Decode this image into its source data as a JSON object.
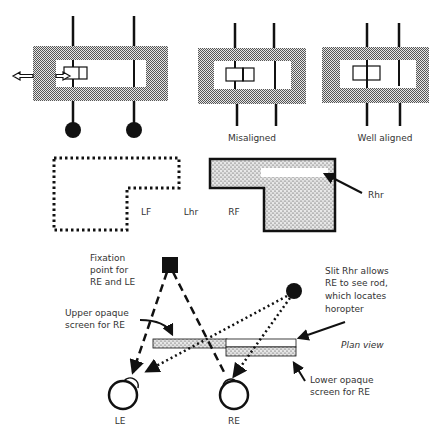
{
  "figure": {
    "colors": {
      "ink": "#111111",
      "text": "#333333",
      "screen_fill": "#bdbdbd",
      "background": "#ffffff"
    }
  },
  "top_row": {
    "panel_1": {
      "label": "",
      "arrows": "double-headed-horizontal-arrow"
    },
    "panel_2": {
      "label": "Misaligned"
    },
    "panel_3": {
      "label": "Well aligned"
    }
  },
  "middle_row": {
    "left_field_label": "LF",
    "left_horopter_label": "Lhr",
    "right_field_label": "RF",
    "right_slit_label": "Rhr"
  },
  "bottom_row": {
    "fixation_label": [
      "Fixation",
      "point for",
      "RE and LE"
    ],
    "upper_screen_label": [
      "Upper opaque",
      "screen for RE"
    ],
    "slit_label": [
      "Slit Rhr allows",
      "RE to see rod,",
      "which locates",
      "horopter"
    ],
    "plan_view_label": "Plan view",
    "lower_screen_label": [
      "Lower opaque",
      "screen for RE"
    ],
    "left_eye_label": "LE",
    "right_eye_label": "RE"
  }
}
